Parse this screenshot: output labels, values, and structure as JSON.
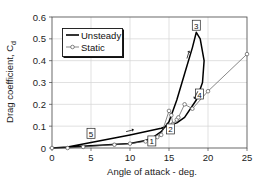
{
  "chart_data": {
    "type": "line",
    "title": "",
    "xlabel": "Angle of attack - deg.",
    "ylabel": "Drag coefficient, C",
    "ylabel_subscript": "d",
    "xlim": [
      0,
      25
    ],
    "ylim": [
      0,
      0.6
    ],
    "x_ticks": [
      "0",
      "5",
      "10",
      "15",
      "20",
      "25"
    ],
    "y_ticks": [
      "0",
      "0.1",
      "0.2",
      "0.3",
      "0.4",
      "0.5",
      "0.6"
    ],
    "grid": true,
    "legend_position": "upper-left",
    "series": [
      {
        "name": "Unsteady",
        "style": "solid-thick",
        "color": "#000000",
        "points": [
          [
            0,
            0.0
          ],
          [
            5,
            0.01
          ],
          [
            10,
            0.02
          ],
          [
            12,
            0.035
          ],
          [
            13,
            0.05
          ],
          [
            14,
            0.075
          ],
          [
            15,
            0.12
          ],
          [
            16,
            0.22
          ],
          [
            17,
            0.34
          ],
          [
            18,
            0.46
          ],
          [
            18.5,
            0.53
          ],
          [
            19,
            0.5
          ],
          [
            19.5,
            0.4
          ],
          [
            19.3,
            0.3
          ],
          [
            18.5,
            0.22
          ],
          [
            17,
            0.14
          ],
          [
            16,
            0.115
          ],
          [
            14,
            0.09
          ],
          [
            10,
            0.06
          ],
          [
            5,
            0.025
          ],
          [
            2,
            0.005
          ],
          [
            0,
            0.0
          ]
        ]
      },
      {
        "name": "Static",
        "style": "thin-with-circles",
        "color": "#555555",
        "points": [
          [
            0,
            0.0
          ],
          [
            2,
            0.0
          ],
          [
            4,
            0.005
          ],
          [
            8,
            0.015
          ],
          [
            10,
            0.02
          ],
          [
            12,
            0.03
          ],
          [
            13,
            0.04
          ],
          [
            13.5,
            0.05
          ],
          [
            14,
            0.06
          ],
          [
            15,
            0.17
          ],
          [
            15.3,
            0.15
          ],
          [
            15.5,
            0.11
          ],
          [
            16,
            0.13
          ],
          [
            16.2,
            0.14
          ],
          [
            17,
            0.2
          ],
          [
            18,
            0.18
          ],
          [
            20,
            0.26
          ],
          [
            25,
            0.43
          ]
        ]
      }
    ],
    "annotations": [
      {
        "label": "1",
        "x": 12.8,
        "y": 0.03
      },
      {
        "label": "2",
        "x": 15.2,
        "y": 0.085
      },
      {
        "label": "3",
        "x": 18.5,
        "y": 0.56
      },
      {
        "label": "4",
        "x": 18.9,
        "y": 0.245
      },
      {
        "label": "5",
        "x": 5,
        "y": 0.065
      }
    ],
    "arrows": [
      {
        "x": 17.3,
        "y": 0.41,
        "direction": "up"
      },
      {
        "x": 18.7,
        "y": 0.26,
        "direction": "down-left"
      },
      {
        "x": 9.5,
        "y": 0.075,
        "direction": "right"
      }
    ]
  },
  "legend": {
    "items": [
      {
        "label": "Unsteady"
      },
      {
        "label": "Static"
      }
    ]
  },
  "axes": {
    "xlabel": "Angle of attack - deg.",
    "ylabel": "Drag coefficient, C",
    "ylabel_sub": "d"
  }
}
